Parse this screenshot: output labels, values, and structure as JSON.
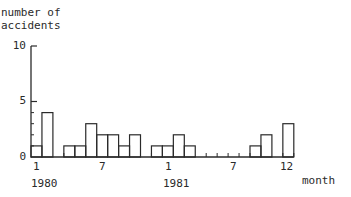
{
  "chart_data": {
    "type": "bar",
    "title": "",
    "ylabel": "number of accidents",
    "xlabel": "month",
    "ylim": [
      0,
      10
    ],
    "yticks": [
      0,
      5,
      10
    ],
    "grid": false,
    "legend": null,
    "xtick_labels": [
      {
        "month_index": 0,
        "label": "1"
      },
      {
        "month_index": 6,
        "label": "7"
      },
      {
        "month_index": 12,
        "label": "1"
      },
      {
        "month_index": 18,
        "label": "7"
      },
      {
        "month_index": 23,
        "label": "12"
      }
    ],
    "year_labels": [
      {
        "month_index": 0,
        "label": "1980"
      },
      {
        "month_index": 12,
        "label": "1981"
      }
    ],
    "categories": [
      "1980-01",
      "1980-02",
      "1980-03",
      "1980-04",
      "1980-05",
      "1980-06",
      "1980-07",
      "1980-08",
      "1980-09",
      "1980-10",
      "1980-11",
      "1980-12",
      "1981-01",
      "1981-02",
      "1981-03",
      "1981-04",
      "1981-05",
      "1981-06",
      "1981-07",
      "1981-08",
      "1981-09",
      "1981-10",
      "1981-11",
      "1981-12"
    ],
    "values": [
      1,
      4,
      0,
      1,
      1,
      3,
      2,
      2,
      1,
      2,
      0,
      1,
      1,
      2,
      1,
      0,
      0,
      0,
      0,
      0,
      1,
      2,
      0,
      3
    ]
  },
  "labels": {
    "ylabel_line1": "number of",
    "ylabel_line2": "accidents",
    "ytick_0": "0",
    "ytick_5": "5",
    "ytick_10": "10",
    "xtick_1980_1": "1",
    "xtick_1980_7": "7",
    "xtick_1981_1": "1",
    "xtick_1981_7": "7",
    "xtick_1981_12": "12",
    "year_1980": "1980",
    "year_1981": "1981",
    "xlabel": "month"
  },
  "style": {
    "ink": "#2a2a2a",
    "background": "#ffffff"
  }
}
